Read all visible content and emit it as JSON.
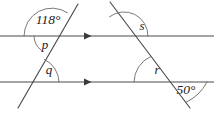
{
  "diagram": {
    "type": "geometry-figure",
    "canvas": {
      "width": 214,
      "height": 118,
      "background": "#ffffff"
    },
    "stroke_color": "#4a4a4a",
    "arc_color": "#6a6a6a",
    "label_color": "#1c1c1c",
    "parallel_lines": [
      {
        "name": "top-parallel-line",
        "y": 36,
        "x1": 0,
        "x2": 214,
        "arrow_marks": 1,
        "arrow_x": 88
      },
      {
        "name": "bottom-parallel-line",
        "y": 82,
        "x1": 0,
        "x2": 214,
        "arrow_marks": 1,
        "arrow_x": 88
      }
    ],
    "transversals": [
      {
        "name": "left-transversal",
        "x1": 78,
        "y1": 4,
        "x2": 18,
        "y2": 108
      },
      {
        "name": "right-transversal",
        "x1": 110,
        "y1": 2,
        "x2": 190,
        "y2": 108
      }
    ],
    "intersections": [
      {
        "name": "left-top-vertex",
        "x": 52,
        "y": 36
      },
      {
        "name": "left-bottom-vertex",
        "x": 34,
        "y": 82
      },
      {
        "name": "right-top-vertex",
        "x": 124,
        "y": 36
      },
      {
        "name": "right-bottom-vertex",
        "x": 162,
        "y": 82
      }
    ],
    "angles": [
      {
        "id": "angle-118",
        "label": "118°",
        "value": 118,
        "known": true,
        "vertex": "left-top-vertex",
        "position": "above-left",
        "label_x": 48,
        "label_y": 21
      },
      {
        "id": "angle-p",
        "label": "p",
        "value": null,
        "known": false,
        "vertex": "left-top-vertex",
        "position": "below-left",
        "label_x": 45,
        "label_y": 46
      },
      {
        "id": "angle-q",
        "label": "q",
        "value": null,
        "known": false,
        "vertex": "left-bottom-vertex",
        "position": "above-right",
        "label_x": 49,
        "label_y": 71
      },
      {
        "id": "angle-s",
        "label": "s",
        "value": null,
        "known": false,
        "vertex": "right-top-vertex",
        "position": "above-right",
        "label_x": 142,
        "label_y": 27
      },
      {
        "id": "angle-r",
        "label": "r",
        "value": null,
        "known": false,
        "vertex": "right-bottom-vertex",
        "position": "above-left",
        "label_x": 157,
        "label_y": 71
      },
      {
        "id": "angle-50",
        "label": "50°",
        "value": 50,
        "known": true,
        "vertex": "right-bottom-vertex",
        "position": "below-right",
        "label_x": 186,
        "label_y": 91
      }
    ]
  }
}
